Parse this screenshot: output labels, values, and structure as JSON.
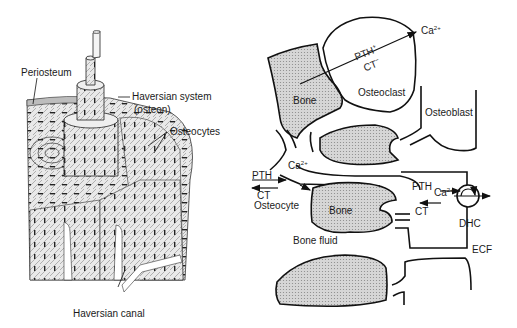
{
  "left_panel": {
    "title": "Bone structure cutaway",
    "labels": {
      "periosteum": "Periosteum",
      "haversian_system": "Haversian system",
      "haversian_system_sub": "(osteon)",
      "osteocytes": "Osteocytes",
      "haversian_canal": "Haversian canal"
    }
  },
  "right_panel": {
    "title": "Calcium exchange between bone and ECF",
    "labels": {
      "bone_top": "Bone",
      "osteoclast": "Osteoclast",
      "pth_plus": "PTH",
      "pth_plus_sup": "+",
      "ct_minus": "CT",
      "ct_minus_sup": "−",
      "ca_top": "Ca",
      "ca_top_sup": "2+",
      "osteoblast": "Osteoblast",
      "pth_left": "PTH",
      "ct_left": "CT",
      "ca_left": "Ca",
      "ca_left_sup": "2+",
      "osteocyte": "Osteocyte",
      "bone_mid": "Bone",
      "pth_right": "PTH",
      "ct_right": "CT",
      "ca_right": "Ca",
      "ca_right_sup": "2+",
      "dhc": "DHC",
      "bone_fluid": "Bone fluid",
      "ecf": "ECF"
    }
  },
  "colors": {
    "line": "#111111",
    "bone_fill": "#c8c8c8",
    "background": "#ffffff"
  }
}
